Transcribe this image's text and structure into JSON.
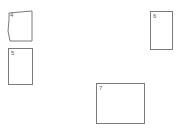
{
  "canvas": {
    "width": 180,
    "height": 132,
    "background_color": "#ffffff",
    "stroke_color": "#7a7a7a",
    "label_color": "#5a5a5a"
  },
  "boxes": [
    {
      "label": "4",
      "shape": "irregular",
      "x": 8,
      "y": 11,
      "width": 25,
      "height": 31,
      "points": "1,2 24,0 24,30 2,30 0,20 1,9"
    },
    {
      "label": "5",
      "shape": "rectangle",
      "x": 8,
      "y": 48,
      "width": 25,
      "height": 37
    },
    {
      "label": "6",
      "shape": "rectangle",
      "x": 150,
      "y": 11,
      "width": 23,
      "height": 39
    },
    {
      "label": "7",
      "shape": "rectangle",
      "x": 96,
      "y": 83,
      "width": 49,
      "height": 41
    }
  ]
}
